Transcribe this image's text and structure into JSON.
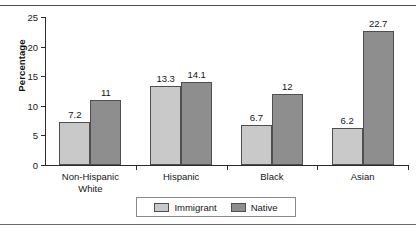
{
  "chart_data": {
    "type": "bar",
    "title": "",
    "xlabel": "",
    "ylabel": "Percentage",
    "ylim": [
      0,
      25
    ],
    "yticks": [
      0,
      5,
      10,
      15,
      20,
      25
    ],
    "ytick_labels": [
      "0",
      "5",
      "10",
      "15",
      "20",
      "25"
    ],
    "grid": false,
    "legend_position": "bottom-center",
    "categories": [
      "Non-Hispanic White",
      "Hispanic",
      "Black",
      "Asian"
    ],
    "category_lines": [
      [
        "Non-Hispanic",
        "White"
      ],
      [
        "Hispanic"
      ],
      [
        "Black"
      ],
      [
        "Asian"
      ]
    ],
    "series": [
      {
        "name": "Immigrant",
        "color": "#c9c9c9",
        "values": [
          7.2,
          13.3,
          6.7,
          6.2
        ],
        "labels": [
          "7.2",
          "13.3",
          "6.7",
          "6.2"
        ]
      },
      {
        "name": "Native",
        "color": "#8e8e8e",
        "values": [
          11,
          14.1,
          12,
          22.7
        ],
        "labels": [
          "11",
          "14.1",
          "12",
          "22.7"
        ]
      }
    ]
  },
  "axis": {
    "y_title": "Percentage"
  },
  "legend": {
    "items": [
      {
        "label": "Immigrant",
        "color": "#c9c9c9"
      },
      {
        "label": "Native",
        "color": "#8e8e8e"
      }
    ]
  },
  "figure": {
    "cropped_title_fragment": ""
  }
}
